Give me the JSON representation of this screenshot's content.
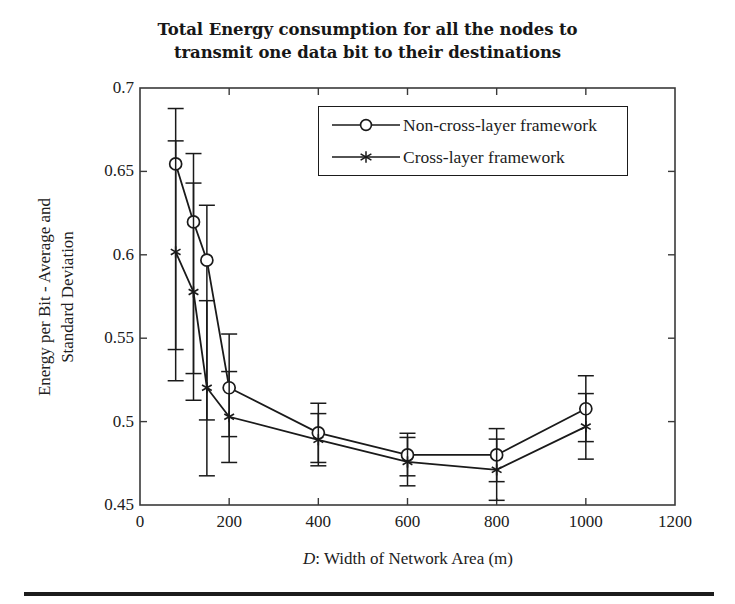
{
  "figure": {
    "title_lines": [
      "Total Energy consumption for all the nodes to",
      "transmit one data bit to their destinations"
    ],
    "title_text": "Total Energy consumption for all the nodes to transmit one data bit to their destinations"
  },
  "axes": {
    "ylabel_lines": [
      "Energy per Bit - Average and",
      "Standard Deviation"
    ],
    "xlabel_prefix": "D",
    "xlabel_rest": ": Width of Network Area (m)",
    "xticklabels": [
      "0",
      "200",
      "400",
      "600",
      "800",
      "1000",
      "1200"
    ],
    "yticklabels": [
      "0.45",
      "0.5",
      "0.55",
      "0.6",
      "0.65",
      "0.7"
    ]
  },
  "legend": {
    "entries": [
      {
        "label": "Non-cross-layer framework",
        "marker": "circle-marker"
      },
      {
        "label": "Cross-layer framework",
        "marker": "star-marker"
      }
    ]
  },
  "chart_data": {
    "type": "line",
    "title": "Total Energy consumption for all the nodes to transmit one data bit to their destinations",
    "xlabel": "D: Width of Network Area (m)",
    "ylabel": "Energy per Bit - Average and Standard Deviation",
    "xlim": [
      0,
      1200
    ],
    "ylim": [
      0.45,
      0.7
    ],
    "xticks": [
      0,
      200,
      400,
      600,
      800,
      1000,
      1200
    ],
    "yticks": [
      0.45,
      0.5,
      0.55,
      0.6,
      0.65,
      0.7
    ],
    "grid": false,
    "legend_position": "upper center",
    "errorbars": true,
    "x": [
      80,
      120,
      150,
      200,
      400,
      600,
      800,
      1000
    ],
    "series": [
      {
        "name": "Non-cross-layer framework",
        "marker": "circle",
        "color": "#1a1a1a",
        "values": [
          0.6545,
          0.6197,
          0.5968,
          0.5203,
          0.4933,
          0.48,
          0.48,
          0.5077
        ],
        "err_low": [
          0.5432,
          0.5288,
          0.501,
          0.491,
          0.4755,
          0.4675,
          0.464,
          0.488
        ],
        "err_high": [
          0.6877,
          0.6607,
          0.6297,
          0.5525,
          0.511,
          0.493,
          0.4958,
          0.5275
        ]
      },
      {
        "name": "Cross-layer framework",
        "marker": "star",
        "color": "#1a1a1a",
        "values": [
          0.6017,
          0.5777,
          0.5203,
          0.5029,
          0.4891,
          0.4758,
          0.4711,
          0.497
        ],
        "err_low": [
          0.5245,
          0.5128,
          0.4675,
          0.4755,
          0.4735,
          0.4615,
          0.4528,
          0.4775
        ],
        "err_high": [
          0.6683,
          0.643,
          0.5725,
          0.53,
          0.5048,
          0.4905,
          0.4895,
          0.5168
        ]
      }
    ]
  }
}
